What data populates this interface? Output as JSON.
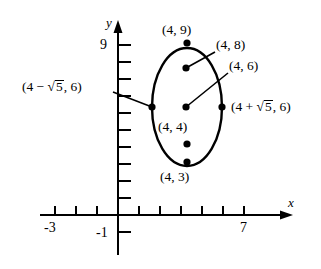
{
  "figure": {
    "type": "ellipse-graph",
    "axes": {
      "x_axis_label": "x",
      "y_axis_label": "y",
      "x_tick_labels": [
        {
          "text": "-3",
          "value": -3
        },
        {
          "text": "7",
          "value": 7
        }
      ],
      "y_tick_labels": [
        {
          "text": "9",
          "value": 9
        }
      ],
      "negative_one_label": "-1",
      "x_range": [
        -4,
        8
      ],
      "y_range": [
        -1,
        10
      ],
      "grid": false
    },
    "curve": {
      "shape": "ellipse",
      "center": [
        4,
        6
      ],
      "semi_major_axis": 3,
      "semi_minor_axis": 2.236,
      "orientation": "vertical"
    },
    "points": [
      {
        "id": "top-vertex",
        "label": "(4, 9)",
        "x": 4,
        "y": 9,
        "label_pos": "above",
        "leader": false
      },
      {
        "id": "focus-upper",
        "label": "(4, 8)",
        "x": 4,
        "y": 8,
        "label_pos": "right",
        "leader": true
      },
      {
        "id": "center",
        "label": "(4, 6)",
        "x": 4,
        "y": 6,
        "label_pos": "right",
        "leader": true
      },
      {
        "id": "focus-lower",
        "label": "(4, 4)",
        "x": 4,
        "y": 4,
        "label_pos": "above",
        "leader": false
      },
      {
        "id": "bottom-vertex",
        "label": "(4, 3)",
        "x": 4,
        "y": 3,
        "label_pos": "below",
        "leader": false
      },
      {
        "id": "left-covertex",
        "label_parts": {
          "prefix": "(4 − ",
          "radical": "5",
          "suffix": ", 6)"
        },
        "x": 1.764,
        "y": 6,
        "label_pos": "left",
        "leader": true
      },
      {
        "id": "right-covertex",
        "label_parts": {
          "prefix": "(4 + ",
          "radical": "5",
          "suffix": ", 6)"
        },
        "x": 6.236,
        "y": 6,
        "label_pos": "right",
        "leader": false
      }
    ],
    "colors": {
      "stroke": "#000000",
      "background": "#ffffff",
      "point_fill": "#000000"
    }
  }
}
